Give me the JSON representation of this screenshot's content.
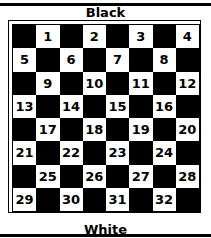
{
  "top_label": "Black",
  "bottom_label": "White",
  "board": {
    "size": 8,
    "colors": {
      "dark": "#000000",
      "light": "#ffffff"
    },
    "rows": [
      [
        "",
        "1",
        "",
        "2",
        "",
        "3",
        "",
        "4"
      ],
      [
        "5",
        "",
        "6",
        "",
        "7",
        "",
        "8",
        ""
      ],
      [
        "",
        "9",
        "",
        "10",
        "",
        "11",
        "",
        "12"
      ],
      [
        "13",
        "",
        "14",
        "",
        "15",
        "",
        "16",
        ""
      ],
      [
        "",
        "17",
        "",
        "18",
        "",
        "19",
        "",
        "20"
      ],
      [
        "21",
        "",
        "22",
        "",
        "23",
        "",
        "24",
        ""
      ],
      [
        "",
        "25",
        "",
        "26",
        "",
        "27",
        "",
        "28"
      ],
      [
        "29",
        "",
        "30",
        "",
        "31",
        "",
        "32",
        ""
      ]
    ]
  }
}
